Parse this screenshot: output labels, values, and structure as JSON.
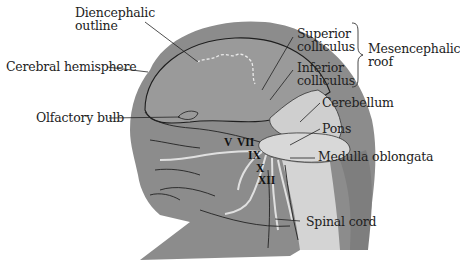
{
  "figure": {
    "colors": {
      "background": "#ffffff",
      "head_tissue": "#8c8c8c",
      "brain_surface": "#9a9a9a",
      "hindbrain_light": "#cfcfcf",
      "leader_line": "#222222",
      "diencephalic_dash": "#e8e8e8"
    }
  },
  "labels": {
    "diencephalic_outline": [
      "Diencephalic",
      "outline"
    ],
    "cerebral_hemisphere": "Cerebral hemisphere",
    "olfactory_bulb": "Olfactory bulb",
    "superior_colliculus": [
      "Superior",
      "colliculus"
    ],
    "inferior_colliculus": [
      "Inferior",
      "colliculus"
    ],
    "mesencephalic_roof": [
      "Mesencephalic",
      "roof"
    ],
    "cerebellum": "Cerebellum",
    "pons": "Pons",
    "medulla_oblongata": "Medulla oblongata",
    "spinal_cord": "Spinal cord"
  },
  "cranial_nerves": {
    "v": "V",
    "vii": "VII",
    "ix": "IX",
    "x": "X",
    "xii": "XII"
  }
}
